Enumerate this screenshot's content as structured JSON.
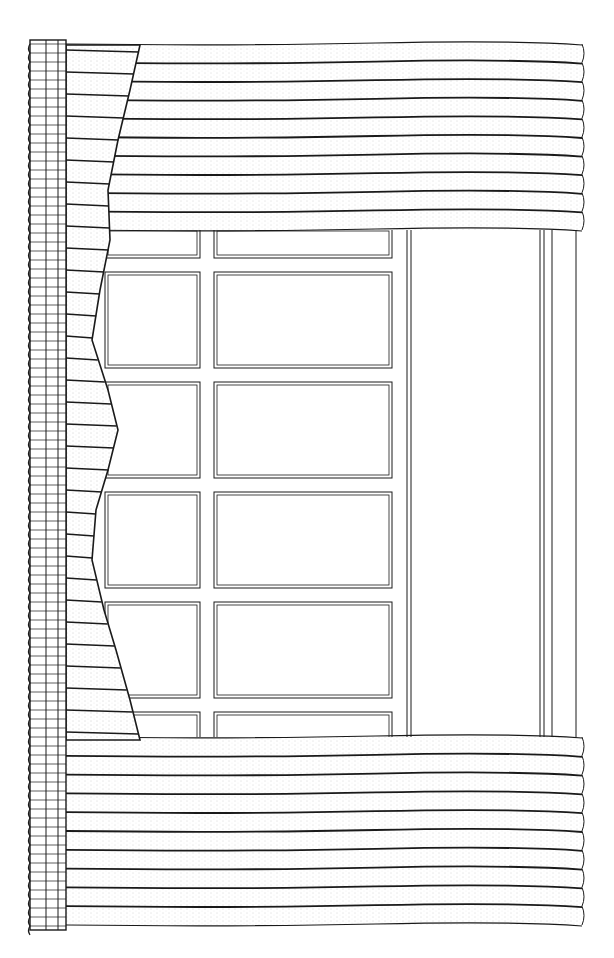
{
  "illustration": {
    "subject": "window with gathered drapery (line drawing, stippled fabric)",
    "colors": {
      "ink": "#1a1a1a",
      "paper": "#ffffff",
      "stipple": "#555555"
    },
    "heading_strip": {
      "x": 30,
      "y": 40,
      "width": 36,
      "height": 890,
      "pleat_spacing": 9
    },
    "top_drape": {
      "x": 66,
      "y": 44,
      "width": 516,
      "height": 186,
      "folds": 10
    },
    "bottom_drape": {
      "x": 66,
      "y": 737,
      "width": 516,
      "height": 188,
      "folds": 10
    },
    "side_drape_edge": [
      [
        140,
        45
      ],
      [
        130,
        90
      ],
      [
        118,
        140
      ],
      [
        108,
        190
      ],
      [
        110,
        240
      ],
      [
        100,
        290
      ],
      [
        92,
        340
      ],
      [
        108,
        390
      ],
      [
        118,
        430
      ],
      [
        108,
        470
      ],
      [
        96,
        510
      ],
      [
        92,
        560
      ],
      [
        104,
        610
      ],
      [
        116,
        650
      ],
      [
        130,
        700
      ],
      [
        140,
        740
      ]
    ],
    "pane_columns": [
      {
        "x": 105,
        "w": 95
      },
      {
        "x": 214,
        "w": 178
      }
    ],
    "pane_rows": [
      {
        "y": 228,
        "h": 30
      },
      {
        "y": 272,
        "h": 96
      },
      {
        "y": 382,
        "h": 96
      },
      {
        "y": 492,
        "h": 96
      },
      {
        "y": 602,
        "h": 96
      },
      {
        "y": 712,
        "h": 30
      }
    ],
    "frame_lines_x": [
      407,
      411,
      540,
      544,
      552,
      576
    ]
  }
}
